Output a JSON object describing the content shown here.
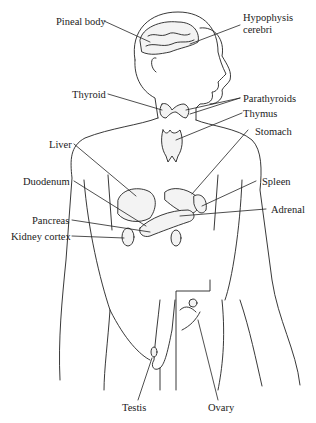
{
  "diagram": {
    "type": "anatomical line drawing",
    "labels": {
      "pineal": "Pineal body",
      "hypophysis_1": "Hypophysis",
      "hypophysis_2": "cerebri",
      "thyroid": "Thyroid",
      "parathyroids": "Parathyroids",
      "thymus": "Thymus",
      "stomach": "Stomach",
      "liver": "Liver",
      "spleen": "Spleen",
      "duodenum": "Duodenum",
      "adrenal": "Adrenal",
      "pancreas": "Pancreas",
      "kidney": "Kidney cortex",
      "testis": "Testis",
      "ovary": "Ovary"
    },
    "colors": {
      "line": "#222222",
      "background": "#ffffff"
    }
  }
}
